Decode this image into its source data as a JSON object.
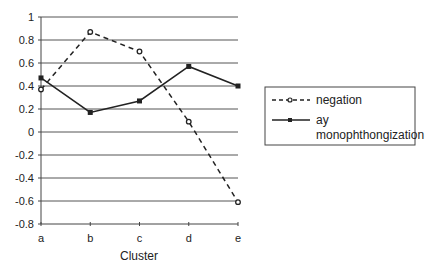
{
  "chart_data": {
    "type": "line",
    "title": "",
    "xlabel": "Cluster",
    "ylabel": "",
    "categories": [
      "a",
      "b",
      "c",
      "d",
      "e"
    ],
    "ylim": [
      -0.8,
      1
    ],
    "yticks": [
      1,
      0.8,
      0.6,
      0.4,
      0.2,
      0,
      -0.2,
      -0.4,
      -0.6,
      -0.8
    ],
    "ytick_labels": [
      "1",
      "0.8",
      "0.6",
      "0.4",
      "0.2",
      "0",
      "-0.2",
      "-0.4",
      "-0.6",
      "-0.8"
    ],
    "grid": true,
    "legend_position": "right",
    "series": [
      {
        "name": "negation",
        "style": "dashed",
        "marker": "open-circle",
        "values": [
          0.37,
          0.87,
          0.7,
          0.09,
          -0.61
        ]
      },
      {
        "name": "ay monophthongization",
        "style": "solid",
        "marker": "filled-square",
        "values": [
          0.47,
          0.17,
          0.27,
          0.57,
          0.4
        ]
      }
    ],
    "legend": {
      "entries": [
        {
          "lines": [
            "negation"
          ]
        },
        {
          "lines": [
            "ay",
            "monophthongization"
          ]
        }
      ]
    }
  },
  "colors": {
    "line": "#222222",
    "grid": "#555555",
    "axis": "#444444"
  }
}
